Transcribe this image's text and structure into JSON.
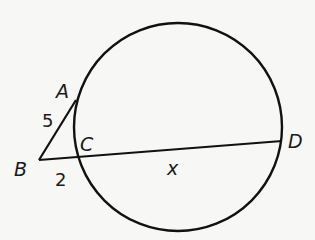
{
  "diagram": {
    "type": "tangent-secant",
    "circle": {
      "cx": 178,
      "cy": 127,
      "r": 104
    },
    "points": {
      "A": {
        "label": "A",
        "x": 74,
        "y": 102
      },
      "B": {
        "label": "B",
        "x": 39,
        "y": 160
      },
      "C": {
        "label": "C",
        "x": 76,
        "y": 158
      },
      "D": {
        "label": "D",
        "x": 282,
        "y": 141
      }
    },
    "segments": {
      "AB": {
        "label": "5"
      },
      "BC": {
        "label": "2"
      },
      "CD": {
        "label": "x"
      }
    },
    "colors": {
      "stroke": "#111111",
      "background": "#f7f7f5"
    }
  }
}
